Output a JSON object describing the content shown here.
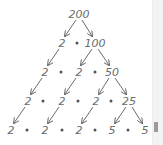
{
  "tree": {
    "title": "Prime factor tree of 200",
    "colors": {
      "text": "#6b6b6b",
      "arrow": "#6b6b6b",
      "dot": "#555555"
    },
    "rows": [
      {
        "y": 14,
        "items": [
          {
            "t": "num",
            "v": "200",
            "x": 79
          }
        ]
      },
      {
        "y": 43,
        "items": [
          {
            "t": "num",
            "v": "2",
            "x": 62
          },
          {
            "t": "dot",
            "x": 77
          },
          {
            "t": "num",
            "v": "100",
            "x": 95
          }
        ]
      },
      {
        "y": 72,
        "items": [
          {
            "t": "num",
            "v": "2",
            "x": 45
          },
          {
            "t": "dot",
            "x": 61
          },
          {
            "t": "num",
            "v": "2",
            "x": 79
          },
          {
            "t": "dot",
            "x": 95
          },
          {
            "t": "num",
            "v": "50",
            "x": 112
          }
        ]
      },
      {
        "y": 101,
        "items": [
          {
            "t": "num",
            "v": "2",
            "x": 28
          },
          {
            "t": "dot",
            "x": 43
          },
          {
            "t": "num",
            "v": "2",
            "x": 62
          },
          {
            "t": "dot",
            "x": 78
          },
          {
            "t": "num",
            "v": "2",
            "x": 96
          },
          {
            "t": "dot",
            "x": 111
          },
          {
            "t": "num",
            "v": "25",
            "x": 129
          }
        ]
      },
      {
        "y": 130,
        "items": [
          {
            "t": "num",
            "v": "2",
            "x": 11
          },
          {
            "t": "dot",
            "x": 27
          },
          {
            "t": "num",
            "v": "2",
            "x": 45
          },
          {
            "t": "dot",
            "x": 62
          },
          {
            "t": "num",
            "v": "2",
            "x": 79
          },
          {
            "t": "dot",
            "x": 95
          },
          {
            "t": "num",
            "v": "5",
            "x": 112
          },
          {
            "t": "dot",
            "x": 128
          },
          {
            "t": "num",
            "v": "5",
            "x": 145
          }
        ]
      }
    ],
    "arrows": [
      {
        "x1": 76,
        "y1": 20,
        "x2": 65,
        "y2": 36
      },
      {
        "x1": 82,
        "y1": 20,
        "x2": 92,
        "y2": 36
      },
      {
        "x1": 59,
        "y1": 49,
        "x2": 48,
        "y2": 65
      },
      {
        "x1": 92,
        "y1": 49,
        "x2": 81,
        "y2": 65
      },
      {
        "x1": 98,
        "y1": 49,
        "x2": 109,
        "y2": 65
      },
      {
        "x1": 42,
        "y1": 78,
        "x2": 31,
        "y2": 94
      },
      {
        "x1": 76,
        "y1": 78,
        "x2": 65,
        "y2": 94
      },
      {
        "x1": 109,
        "y1": 78,
        "x2": 99,
        "y2": 94
      },
      {
        "x1": 115,
        "y1": 78,
        "x2": 126,
        "y2": 94
      },
      {
        "x1": 25,
        "y1": 107,
        "x2": 14,
        "y2": 123
      },
      {
        "x1": 59,
        "y1": 107,
        "x2": 48,
        "y2": 123
      },
      {
        "x1": 93,
        "y1": 107,
        "x2": 82,
        "y2": 123
      },
      {
        "x1": 126,
        "y1": 107,
        "x2": 115,
        "y2": 123
      },
      {
        "x1": 132,
        "y1": 107,
        "x2": 142,
        "y2": 123
      }
    ]
  },
  "scrollbar": {
    "track_color": "#f3f3f3",
    "thumb_color": "#9a9a9a"
  }
}
